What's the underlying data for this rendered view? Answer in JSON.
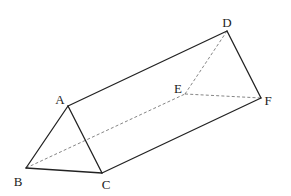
{
  "diagram": {
    "type": "triangular-prism",
    "vertices": [
      {
        "id": "A",
        "label": "A",
        "x": 68,
        "y": 106,
        "lx": 60,
        "ly": 104
      },
      {
        "id": "B",
        "label": "B",
        "x": 26,
        "y": 168,
        "lx": 18,
        "ly": 186
      },
      {
        "id": "C",
        "label": "C",
        "x": 102,
        "y": 173,
        "lx": 106,
        "ly": 189
      },
      {
        "id": "D",
        "label": "D",
        "x": 227,
        "y": 31,
        "lx": 227,
        "ly": 27
      },
      {
        "id": "E",
        "label": "E",
        "x": 185,
        "y": 94,
        "lx": 178,
        "ly": 93
      },
      {
        "id": "F",
        "label": "F",
        "x": 261,
        "y": 98,
        "lx": 268,
        "ly": 105
      }
    ],
    "solid_edges": [
      [
        "A",
        "B"
      ],
      [
        "A",
        "C"
      ],
      [
        "B",
        "C"
      ],
      [
        "A",
        "D"
      ],
      [
        "D",
        "F"
      ],
      [
        "C",
        "F"
      ]
    ],
    "dashed_edges": [
      [
        "B",
        "E"
      ],
      [
        "D",
        "E"
      ],
      [
        "E",
        "F"
      ]
    ],
    "colors": {
      "solid": "#222222",
      "dashed": "#666666",
      "background": "#ffffff"
    }
  },
  "labels": {
    "A": "A",
    "B": "B",
    "C": "C",
    "D": "D",
    "E": "E",
    "F": "F"
  }
}
